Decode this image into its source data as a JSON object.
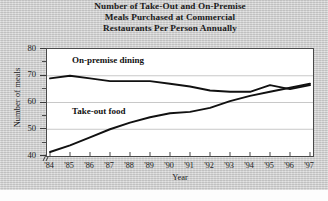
{
  "chart_data": {
    "type": "line",
    "title": "Number of Take-Out and On-Premise Meals Purchased at Commercial Restaurants Per Person Annually",
    "title_lines": [
      "Number of Take-Out and On-Premise",
      "Meals Purchased at Commercial",
      "Restaurants Per Person Annually"
    ],
    "xlabel": "Year",
    "ylabel": "Number of meals",
    "x": [
      "'84",
      "'85",
      "'86",
      "'87",
      "'88",
      "'89",
      "'90",
      "'91",
      "'92",
      "'93",
      "'94",
      "'95",
      "'96",
      "'97"
    ],
    "categories": [
      "'84",
      "'85",
      "'86",
      "'87",
      "'88",
      "'89",
      "'90",
      "'91",
      "'92",
      "'93",
      "'94",
      "'95",
      "'96",
      "'97"
    ],
    "ylim": [
      40,
      80
    ],
    "y_ticks": [
      40,
      50,
      60,
      70,
      80
    ],
    "y_minor_ticks": [
      45,
      55,
      65,
      75
    ],
    "y_axis_break": true,
    "grid": "horizontal",
    "legend_position": "inline-labels",
    "series": [
      {
        "name": "On-premise dining",
        "values": [
          69,
          70,
          69,
          68,
          68,
          68,
          67,
          66,
          64.5,
          64,
          64,
          66.5,
          65,
          66.5
        ],
        "color": "#111111"
      },
      {
        "name": "Take-out food",
        "values": [
          41.5,
          44,
          47,
          50,
          52.5,
          54.5,
          56,
          56.5,
          58,
          60.5,
          62.5,
          64,
          65.5,
          67
        ],
        "color": "#111111"
      }
    ],
    "annotations": [
      {
        "text": "On-premise dining",
        "x": "'85",
        "y": 75
      },
      {
        "text": "Take-out food",
        "x": "'85",
        "y": 56
      }
    ]
  },
  "colors": {
    "figure_background": "#cfcfcf",
    "plot_background": "#ffffff",
    "line": "#111111",
    "gridline": "#c8c8c8",
    "axis": "#4a4a4a",
    "text": "#1c1c1c"
  }
}
